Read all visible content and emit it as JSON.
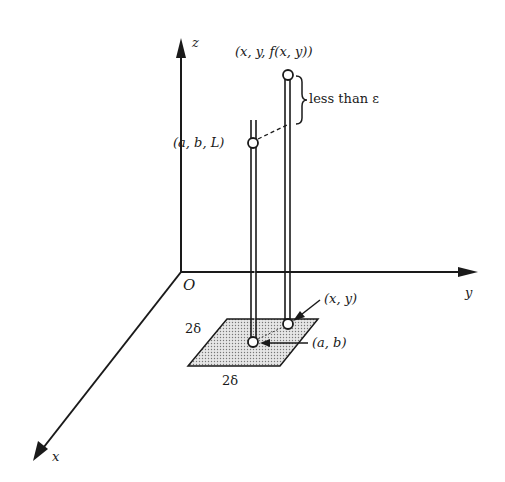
{
  "diagram": {
    "type": "3d-limit-illustration",
    "axes": {
      "z_label": "z",
      "y_label": "y",
      "x_label": "x",
      "origin_label": "O"
    },
    "points": {
      "top_point_label": "(x, y, f(x, y))",
      "limit_point_label": "(a, b, L)",
      "xy_point_label": "(x, y)",
      "ab_point_label": "(a, b)"
    },
    "annotations": {
      "brace_label": "less than ε",
      "square_side_left": "2δ",
      "square_side_bottom": "2δ"
    },
    "colors": {
      "ink": "#1a1a1a",
      "background": "#ffffff",
      "shade": "#c8c8c8"
    }
  }
}
